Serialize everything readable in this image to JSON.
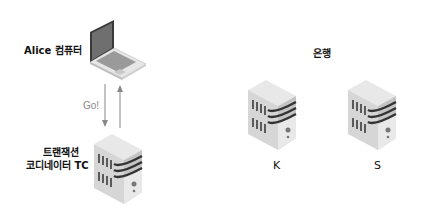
{
  "diagram": {
    "client": {
      "label": "Alice 컴퓨터",
      "icon": "laptop-icon"
    },
    "coordinator": {
      "label_line1": "트랜잭션",
      "label_line2": "코디네이터 TC",
      "icon": "server-icon"
    },
    "message": {
      "label": "Go!"
    },
    "banks": {
      "title": "은행",
      "servers": [
        {
          "label": "K",
          "icon": "server-icon"
        },
        {
          "label": "S",
          "icon": "server-icon"
        }
      ]
    },
    "colors": {
      "server_light": "#e4e4e4",
      "server_mid": "#cfcfcf",
      "server_dark": "#b9b9b9",
      "stripe": "#333333",
      "arrow": "#888888",
      "laptop_screen": "#6f6f6f"
    }
  }
}
